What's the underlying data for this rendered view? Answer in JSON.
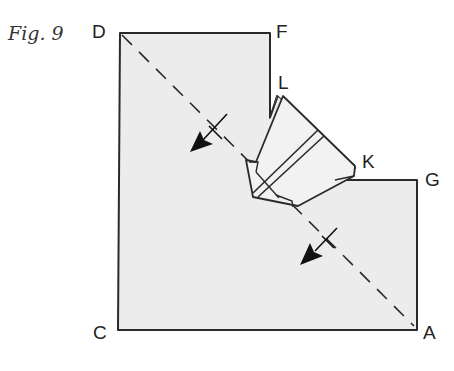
{
  "figure": {
    "caption": "Fig. 9",
    "colors": {
      "paper_fill": "#ececec",
      "stroke": "#2a2a2a",
      "background": "#ffffff"
    },
    "labels": {
      "D": "D",
      "F": "F",
      "L": "L",
      "K": "K",
      "G": "G",
      "C": "C",
      "A": "A"
    },
    "diagonal": {
      "style": "dashed",
      "from": "D",
      "to": "A"
    },
    "arrows": [
      {
        "name": "fold-arrow-upper",
        "direction": "down-left"
      },
      {
        "name": "fold-arrow-lower",
        "direction": "down-left"
      }
    ]
  }
}
